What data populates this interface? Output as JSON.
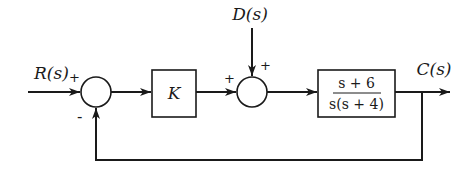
{
  "diagram": {
    "type": "block-diagram",
    "signals": {
      "input": "R(s)",
      "disturbance": "D(s)",
      "output": "C(s)"
    },
    "summing_junctions": [
      {
        "id": "sum1",
        "signs": {
          "top_left": "+",
          "bottom": "-"
        }
      },
      {
        "id": "sum2",
        "signs": {
          "left": "+",
          "top": "+"
        }
      }
    ],
    "blocks": [
      {
        "id": "controller",
        "label": "K"
      },
      {
        "id": "plant",
        "numerator": "s + 6",
        "denominator": "s(s + 4)"
      }
    ],
    "feedback": "unity negative feedback from C(s) to sum1",
    "colors": {
      "ink": "#1a1a1a",
      "background": "#ffffff"
    }
  }
}
